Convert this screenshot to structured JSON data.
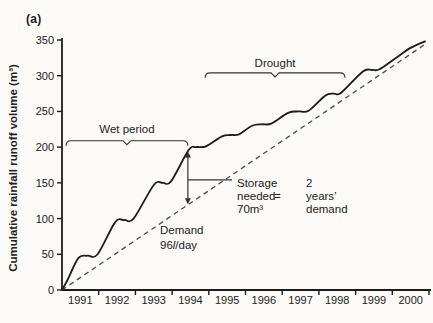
{
  "figure": {
    "panel_label": "(a)",
    "ink_color": "#1c1c1c",
    "dashed_color": "#4a4a4a",
    "background": "#fbfaf7"
  },
  "chart_data": {
    "type": "line",
    "title": "",
    "xlabel": "",
    "ylabel": "Cumulative rainfall runoff volume (m³)",
    "x_categories": [
      "1991",
      "1992",
      "1993",
      "1994",
      "1995",
      "1996",
      "1997",
      "1998",
      "1999",
      "2000"
    ],
    "y_ticks": [
      0,
      50,
      100,
      150,
      200,
      250,
      300,
      350
    ],
    "x_range_years": [
      1991,
      2001
    ],
    "ylim": [
      0,
      350
    ],
    "grid": false,
    "legend": "none",
    "series": [
      {
        "name": "cumulative-rainfall-runoff",
        "style": "solid",
        "points": [
          [
            1991.0,
            0
          ],
          [
            1991.15,
            14
          ],
          [
            1991.45,
            45
          ],
          [
            1991.7,
            48
          ],
          [
            1991.97,
            50
          ],
          [
            1992.45,
            95
          ],
          [
            1992.7,
            98
          ],
          [
            1992.95,
            100
          ],
          [
            1993.5,
            147
          ],
          [
            1993.75,
            150
          ],
          [
            1993.97,
            152
          ],
          [
            1994.45,
            196
          ],
          [
            1994.65,
            200
          ],
          [
            1994.92,
            201
          ],
          [
            1995.36,
            215
          ],
          [
            1995.6,
            217
          ],
          [
            1995.82,
            218
          ],
          [
            1996.18,
            230
          ],
          [
            1996.45,
            232
          ],
          [
            1996.7,
            233
          ],
          [
            1997.16,
            248
          ],
          [
            1997.45,
            250
          ],
          [
            1997.72,
            251
          ],
          [
            1998.17,
            272
          ],
          [
            1998.4,
            275
          ],
          [
            1998.6,
            276
          ],
          [
            1999.2,
            306
          ],
          [
            1999.45,
            308
          ],
          [
            1999.65,
            309
          ],
          [
            2000.1,
            325
          ],
          [
            2000.5,
            339
          ],
          [
            2000.89,
            348
          ]
        ]
      },
      {
        "name": "demand",
        "style": "dashed",
        "points": [
          [
            1991.0,
            0
          ],
          [
            2000.95,
            346
          ]
        ]
      }
    ],
    "annotations": {
      "wet_period": {
        "label": "Wet period",
        "year_start": 1991.11,
        "year_end": 1994.43,
        "value": 209
      },
      "drought": {
        "label": "Drought",
        "year_start": 1994.9,
        "year_end": 1998.71,
        "value": 304
      },
      "storage": {
        "arrow_year": 1994.43,
        "arrow_top_value": 194,
        "arrow_bottom_value": 120,
        "lines_left": [
          "Storage",
          "needed",
          "70m³"
        ],
        "equals": "=",
        "lines_right": [
          "2",
          "years’",
          "demand"
        ]
      },
      "demand_note": {
        "line1": "Demand",
        "line2_parts": [
          "96",
          "l",
          "/day"
        ]
      }
    }
  }
}
